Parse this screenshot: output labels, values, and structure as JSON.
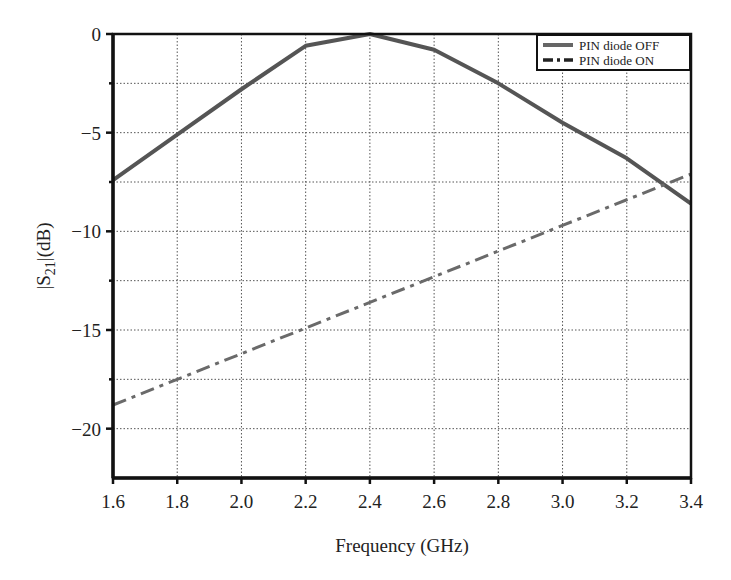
{
  "chart_data": {
    "type": "line",
    "title": "",
    "xlabel": "Frequency (GHz)",
    "ylabel": "|S21|(dB)",
    "ylabel_main": "|S",
    "ylabel_sub": "21",
    "ylabel_tail": "|(dB)",
    "xlim": [
      1.6,
      3.4
    ],
    "ylim": [
      -22.5,
      0
    ],
    "xticks": [
      1.6,
      1.8,
      2.0,
      2.2,
      2.4,
      2.6,
      2.8,
      3.0,
      3.2,
      3.4
    ],
    "xtick_labels": [
      "1.6",
      "1.8",
      "2.0",
      "2.2",
      "2.4",
      "2.6",
      "2.8",
      "3.0",
      "3.2",
      "3.4"
    ],
    "yticks": [
      0,
      -5,
      -10,
      -15,
      -20
    ],
    "ytick_labels": [
      "0",
      "−5",
      "−10",
      "−15",
      "−20"
    ],
    "minor_yticks": [
      -2.5,
      -7.5,
      -12.5,
      -17.5
    ],
    "grid": true,
    "legend_position": "upper right",
    "x": [
      1.6,
      1.8,
      2.0,
      2.2,
      2.4,
      2.6,
      2.8,
      3.0,
      3.2,
      3.4
    ],
    "series": [
      {
        "name": "PIN diode OFF",
        "style": "solid",
        "color": "#555555",
        "values": [
          -7.4,
          -5.1,
          -2.8,
          -0.6,
          0.0,
          -0.8,
          -2.5,
          -4.5,
          -6.3,
          -8.6
        ]
      },
      {
        "name": "PIN diode ON",
        "style": "dash-dot",
        "color": "#6a6a6a",
        "values": [
          -18.8,
          -17.5,
          -16.2,
          -14.9,
          -13.6,
          -12.3,
          -11.0,
          -9.7,
          -8.4,
          -7.1
        ]
      }
    ]
  },
  "legend": {
    "items": [
      "PIN diode OFF",
      "PIN diode ON"
    ]
  }
}
